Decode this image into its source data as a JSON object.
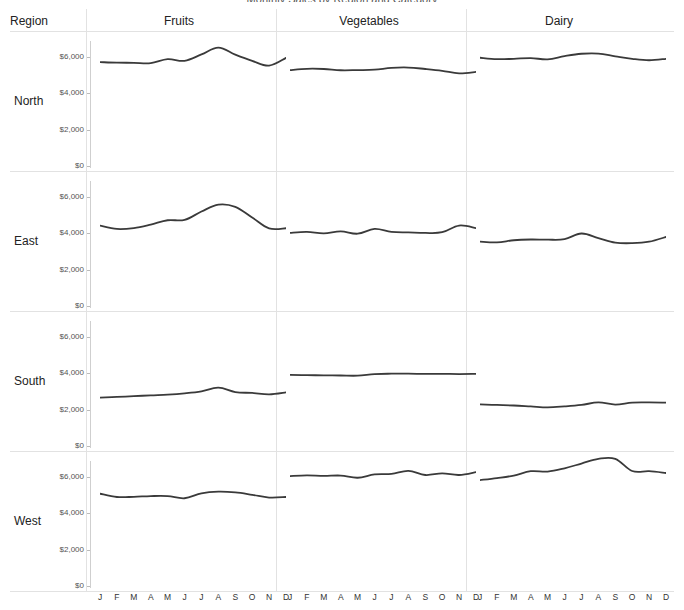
{
  "title": "Monthly Sales by Region and Category",
  "row_header_label": "Region",
  "columns": [
    "Fruits",
    "Vegetables",
    "Dairy"
  ],
  "rows": [
    "North",
    "East",
    "South",
    "West"
  ],
  "y_ticks": [
    "$6,000",
    "$4,000",
    "$2,000",
    "$0"
  ],
  "x_ticks": [
    "J",
    "F",
    "M",
    "A",
    "M",
    "J",
    "J",
    "A",
    "S",
    "O",
    "N",
    "D"
  ],
  "colors": {
    "line": "#3a3a3a",
    "grid": "#e2e2e2",
    "axis": "#cfcfcf",
    "text": "#222222",
    "tick_text": "#555555"
  },
  "chart_data": {
    "type": "line",
    "title": "Monthly Sales by Region and Category",
    "subtitle": "",
    "xlabel": "",
    "ylabel": "",
    "ylim": [
      0,
      7000
    ],
    "y_tick_values": [
      0,
      2000,
      4000,
      6000
    ],
    "grid": true,
    "legend": "none",
    "layout": "small-multiples 4 rows x 3 columns",
    "row_variable": "Region",
    "column_variable": "Category",
    "x": [
      "J",
      "F",
      "M",
      "A",
      "M",
      "J",
      "J",
      "A",
      "S",
      "O",
      "N",
      "D"
    ],
    "panels": [
      {
        "row": "North",
        "column": "Fruits",
        "values": [
          5720,
          5690,
          5680,
          5660,
          5880,
          5790,
          6140,
          6520,
          6130,
          5790,
          5530,
          5950
        ]
      },
      {
        "row": "North",
        "column": "Vegetables",
        "values": [
          5280,
          5350,
          5340,
          5270,
          5280,
          5300,
          5400,
          5420,
          5340,
          5240,
          5100,
          5180
        ]
      },
      {
        "row": "North",
        "column": "Dairy",
        "values": [
          5960,
          5880,
          5900,
          5940,
          5870,
          6050,
          6180,
          6190,
          6040,
          5900,
          5820,
          5900
        ]
      },
      {
        "row": "East",
        "column": "Fruits",
        "values": [
          4420,
          4240,
          4290,
          4480,
          4720,
          4740,
          5200,
          5580,
          5460,
          4870,
          4270,
          4280,
          4620
        ]
      },
      {
        "row": "East",
        "column": "Vegetables",
        "values": [
          4030,
          4080,
          4000,
          4110,
          3980,
          4240,
          4080,
          4050,
          4020,
          4060,
          4430,
          4290,
          4120
        ]
      },
      {
        "row": "East",
        "column": "Dairy",
        "values": [
          3540,
          3500,
          3620,
          3660,
          3650,
          3680,
          3990,
          3740,
          3490,
          3460,
          3540,
          3800
        ]
      },
      {
        "row": "South",
        "column": "Fruits",
        "values": [
          2660,
          2700,
          2740,
          2790,
          2830,
          2900,
          3010,
          3210,
          2970,
          2920,
          2840,
          2950
        ]
      },
      {
        "row": "South",
        "column": "Vegetables",
        "values": [
          3920,
          3900,
          3890,
          3880,
          3870,
          3960,
          3980,
          3980,
          3970,
          3970,
          3960,
          3970
        ]
      },
      {
        "row": "South",
        "column": "Dairy",
        "values": [
          2290,
          2260,
          2230,
          2180,
          2130,
          2180,
          2260,
          2400,
          2280,
          2390,
          2400,
          2390
        ]
      },
      {
        "row": "West",
        "column": "Fruits",
        "values": [
          5080,
          4900,
          4910,
          4950,
          4950,
          4830,
          5100,
          5190,
          5150,
          5020,
          4870,
          4900,
          5030
        ]
      },
      {
        "row": "West",
        "column": "Vegetables",
        "values": [
          6050,
          6090,
          6060,
          6080,
          5960,
          6140,
          6170,
          6340,
          6110,
          6200,
          6110,
          6270
        ]
      },
      {
        "row": "West",
        "column": "Dairy",
        "values": [
          5830,
          5940,
          6080,
          6320,
          6300,
          6480,
          6740,
          7000,
          7000,
          6330,
          6320,
          6220,
          6760
        ]
      }
    ]
  }
}
